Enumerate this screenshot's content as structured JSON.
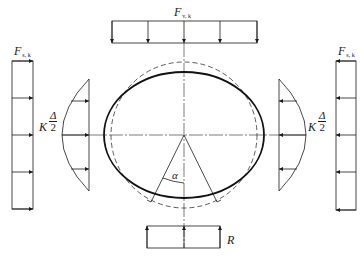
{
  "diagram": {
    "colors": {
      "stroke": "#1a1a1a",
      "thin": "#444444",
      "background": "#ffffff"
    },
    "labels": {
      "top_load": {
        "main": "F",
        "sub": "v, k"
      },
      "left_load": {
        "main": "F",
        "sub": "s, k"
      },
      "right_load": {
        "main": "F",
        "sub": "s, k"
      },
      "left_reaction_coef": "K",
      "left_reaction_num": "Δ",
      "left_reaction_den": "2",
      "right_reaction_coef": "K",
      "right_reaction_num": "Δ",
      "right_reaction_den": "2",
      "angle": "α",
      "bottom_reaction": "R"
    },
    "geometry": {
      "center": [
        184,
        135
      ],
      "ellipse_deformed": {
        "rx": 80,
        "ry": 63
      },
      "circle_original": {
        "r": 73
      },
      "top_load_rect": {
        "x": 112,
        "y": 21,
        "w": 145,
        "h": 22,
        "arrows_x": [
          112,
          148,
          184,
          220,
          257
        ]
      },
      "left_load_rect": {
        "x": 12,
        "y": 61,
        "w": 21,
        "h": 148,
        "arrows_y": [
          61,
          98,
          135,
          172,
          209
        ]
      },
      "right_load_rect": {
        "x": 336,
        "y": 61,
        "w": 20,
        "h": 149,
        "arrows_y": [
          61,
          98,
          135,
          172,
          210
        ]
      },
      "left_parabola": {
        "line_x": 89,
        "top_y": 79,
        "bottom_y": 191,
        "apex_x": 62,
        "arrows_y": [
          101,
          135,
          169
        ]
      },
      "right_parabola": {
        "line_x": 279,
        "top_y": 79,
        "bottom_y": 191,
        "apex_x": 306,
        "arrows_y": [
          101,
          135,
          169
        ]
      },
      "bottom_reaction_rect": {
        "x": 147,
        "y": 226,
        "w": 73,
        "h": 22,
        "arrows_x": [
          147,
          184,
          220
        ]
      },
      "angle_rays_end": [
        [
          151,
          202
        ],
        [
          217,
          202
        ]
      ]
    }
  }
}
